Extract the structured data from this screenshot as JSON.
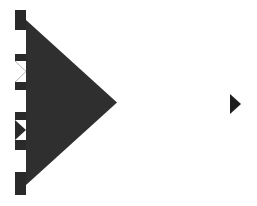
{
  "colors": {
    "background": "#ffffff",
    "arrow_fill": "#2f2f2f",
    "strip_dark": "#2a2a2a",
    "strip_light": "#ffffff",
    "x_mark": "#b5b5b5",
    "small_arrow_fill": "#1e1e1e"
  },
  "controls": {
    "main_arrow": {
      "icon": "triangle-right-icon",
      "direction": "right"
    },
    "strip_segments": [
      {
        "type": "dark",
        "top": 0,
        "height": 20
      },
      {
        "type": "light",
        "top": 20,
        "height": 24
      },
      {
        "type": "dark",
        "top": 44,
        "height": 7
      },
      {
        "type": "x-box",
        "top": 51,
        "height": 21,
        "icon": "x-icon"
      },
      {
        "type": "dark",
        "top": 72,
        "height": 8
      },
      {
        "type": "light",
        "top": 80,
        "height": 22
      },
      {
        "type": "dark",
        "top": 102,
        "height": 8
      },
      {
        "type": "triangle-box",
        "top": 110,
        "height": 20,
        "icon": "triangle-right-icon"
      },
      {
        "type": "dark",
        "top": 130,
        "height": 10
      },
      {
        "type": "light",
        "top": 140,
        "height": 22
      },
      {
        "type": "dark",
        "top": 162,
        "height": 23
      }
    ],
    "small_arrow": {
      "icon": "play-icon",
      "direction": "right"
    }
  }
}
